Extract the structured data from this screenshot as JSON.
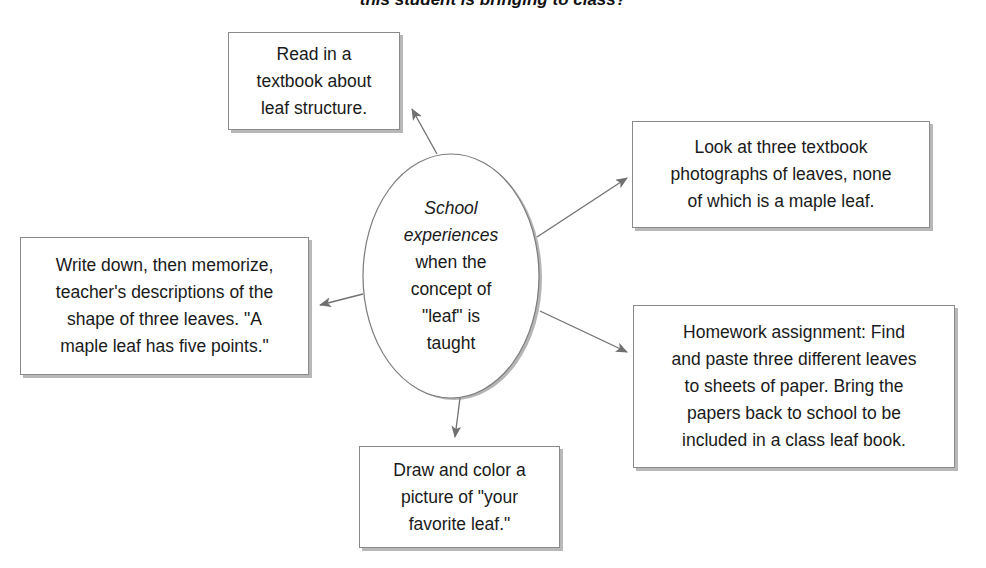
{
  "title": "this student is bringing to class?",
  "center": {
    "line1": "School",
    "line2": "experiences",
    "line3": "when the",
    "line4": "concept of",
    "line5": "\"leaf\" is",
    "line6": "taught"
  },
  "boxes": [
    {
      "id": "textbook-reading",
      "lines": [
        "Read in a",
        "textbook about",
        "leaf structure."
      ]
    },
    {
      "id": "textbook-photos",
      "lines": [
        "Look at three textbook",
        "photographs of leaves, none",
        "of which is a maple leaf."
      ]
    },
    {
      "id": "memorize-descriptions",
      "lines": [
        "Write down, then memorize,",
        "teacher's descriptions of the",
        "shape of three leaves. \"A",
        "maple leaf has five points.\""
      ]
    },
    {
      "id": "homework",
      "lines": [
        "Homework assignment: Find",
        "and paste three different leaves",
        "to sheets of paper. Bring the",
        "papers back to school to be",
        "included in a class leaf book."
      ]
    },
    {
      "id": "draw-leaf",
      "lines": [
        "Draw and color a",
        "picture of \"your",
        "favorite leaf.\""
      ]
    }
  ],
  "colors": {
    "line": "#707070",
    "border": "#8a8a8a",
    "shadow": "#b8b8b8"
  }
}
